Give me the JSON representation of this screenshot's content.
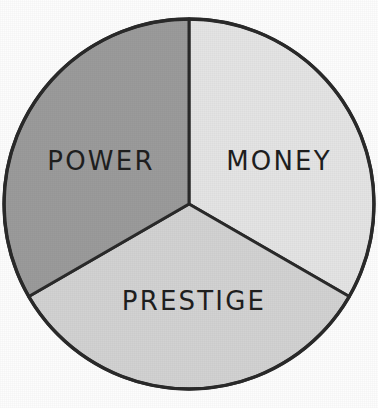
{
  "figure": {
    "background_color": "#fdfdfd",
    "outline_color": "#2a2a2a",
    "label_color": "#1f1f1f"
  },
  "chart_data": {
    "type": "pie",
    "title": "",
    "subtitle": "",
    "xlabel": "",
    "ylabel": "",
    "grid": false,
    "legend_position": "none",
    "labels_placement": "inside-slices",
    "start_angle_deg": 0,
    "direction": "clockwise",
    "center": {
      "x": 189,
      "y": 204
    },
    "radius": 185,
    "total": 100,
    "categories": [
      "MONEY",
      "PRESTIGE",
      "POWER"
    ],
    "values": [
      33.3,
      33.3,
      33.3
    ],
    "slices": [
      {
        "label": "MONEY",
        "value": 33.3,
        "percent": "33.3%",
        "angle_deg": 120,
        "start_deg": 0,
        "end_deg": 120,
        "color": "#e4e4e4",
        "label_x": 279,
        "label_y": 161
      },
      {
        "label": "PRESTIGE",
        "value": 33.3,
        "percent": "33.3%",
        "angle_deg": 120,
        "start_deg": 120,
        "end_deg": 240,
        "color": "#d2d2d2",
        "label_x": 194,
        "label_y": 301
      },
      {
        "label": "POWER",
        "value": 33.3,
        "percent": "33.3%",
        "angle_deg": 120,
        "start_deg": 240,
        "end_deg": 360,
        "color": "#9b9b9b",
        "label_x": 101,
        "label_y": 161
      }
    ]
  }
}
